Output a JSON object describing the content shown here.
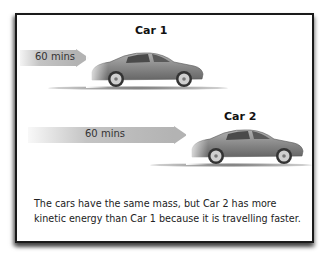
{
  "diagram": {
    "car1": {
      "title": "Car 1",
      "arrow_label": "60 mins",
      "color": "#8a8a8a"
    },
    "car2": {
      "title": "Car 2",
      "arrow_label": "60 mins",
      "color": "#8a8a8a"
    },
    "caption": "The cars have the same mass, but Car 2 has more kinetic energy than Car 1 because it is travelling faster.",
    "colors": {
      "frame_border": "#1a1a1a",
      "arrow_fill": "#b3b3b3",
      "car_body": "#8a8a8a"
    }
  }
}
